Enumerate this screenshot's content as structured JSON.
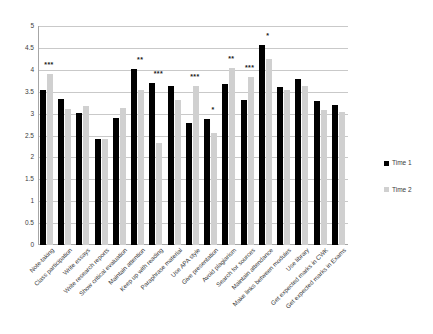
{
  "chart_data": {
    "type": "bar",
    "title": "",
    "subtitle": "",
    "xlabel": "",
    "ylabel": "",
    "ylim": [
      0,
      5
    ],
    "ytick_step": 0.5,
    "ytick_labels": [
      "5",
      "4.5",
      "4",
      "3.5",
      "3",
      "2.5",
      "2",
      "1.5",
      "1",
      "0.5",
      "0"
    ],
    "grid": true,
    "legend_position": "right",
    "categories": [
      "Note-taking",
      "Class participation",
      "Write essays",
      "Write research reports",
      "Show critical evaluation",
      "Maintain attention",
      "Keep up with reading",
      "Paraphrase material",
      "Use APA style",
      "Give presentation",
      "Avoid plagiarism",
      "Search for sources",
      "Maintain attendance",
      "Make links between modules",
      "Use library",
      "Get expected marks in CWK",
      "Get expected marks in Exams"
    ],
    "series": [
      {
        "name": "Time 1",
        "color": "#000000",
        "values": [
          3.55,
          3.34,
          3.01,
          2.42,
          2.91,
          4.01,
          3.69,
          3.62,
          2.78,
          2.88,
          3.68,
          3.31,
          4.56,
          3.6,
          3.8,
          3.29,
          3.2
        ]
      },
      {
        "name": "Time 2",
        "color": "#d0d0d0",
        "values": [
          3.9,
          3.11,
          3.17,
          2.41,
          3.13,
          3.55,
          2.34,
          3.32,
          3.62,
          2.55,
          4.04,
          3.83,
          4.25,
          3.53,
          3.64,
          3.09,
          3.04
        ]
      }
    ],
    "significance": [
      "***",
      "",
      "",
      "",
      "",
      "**",
      "***",
      "",
      "***",
      "*",
      "**",
      "***",
      "*",
      "",
      "",
      "",
      ""
    ]
  },
  "legend": {
    "entries": [
      {
        "label": "Time 1",
        "color": "#000000"
      },
      {
        "label": "Time 2",
        "color": "#d0d0d0"
      }
    ]
  }
}
